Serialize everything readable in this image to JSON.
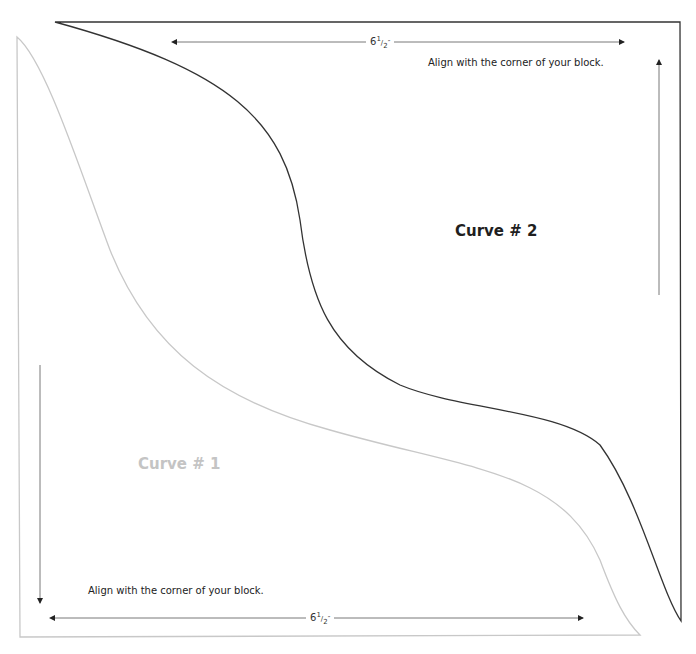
{
  "template": {
    "curve1": {
      "label": "Curve # 1",
      "color": "#c8c8c8",
      "dimension": {
        "whole": "6",
        "num": "1",
        "den": "2",
        "unit": "″"
      },
      "align_note": "Align with the corner of your block."
    },
    "curve2": {
      "label": "Curve # 2",
      "color": "#333333",
      "dimension": {
        "whole": "6",
        "num": "1",
        "den": "2",
        "unit": "″"
      },
      "align_note": "Align with the corner of your block."
    }
  }
}
